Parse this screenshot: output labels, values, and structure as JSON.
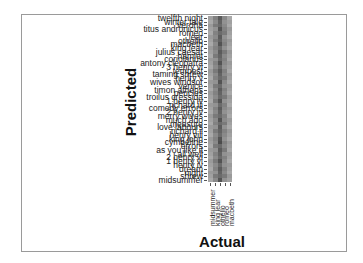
{
  "chart_data": {
    "type": "heatmap",
    "title": "",
    "xlabel": "Actual",
    "ylabel": "Predicted",
    "x_categories": [
      "midsummer",
      "king lear",
      "othello",
      "romeo",
      "macbeth"
    ],
    "x_categories_note": "approximate; only 'midsummer' is clearly legible",
    "y_categories": [
      "twelfth night",
      "winter tale",
      "verona",
      "titus andronicus",
      "romeo",
      "lear",
      "othello",
      "macbeth",
      "king lear",
      "julius caesar",
      "hamlet",
      "coriolanus",
      "antony cleopatra",
      "3 henry vi",
      "tempest",
      "taming shrew",
      "henry v",
      "wives windsor",
      "venice",
      "timon athens",
      "pericles",
      "troilus cressida",
      "1 henry iv",
      "richard iii",
      "comedy errors",
      "2 henry iv",
      "merry wives",
      "much ado",
      "measure",
      "love labours",
      "richard ii",
      "henry viii",
      "king john",
      "cymbeline",
      "errors",
      "as you like it",
      "all well",
      "2 henry vi",
      "1 henry vi",
      "henry iv",
      "dream",
      "night",
      "shrew",
      "midsummer"
    ],
    "y_categories_note": "approximate; labels overlap heavily and are only partially legible",
    "values_note": "illustrative only: cell values are not legible at this resolution; intensities were chosen to match the visible dark-band pattern, not read from the image",
    "values": [
      [
        0.35,
        0.55,
        0.8,
        0.5,
        0.3
      ],
      [
        0.3,
        0.5,
        0.75,
        0.45,
        0.35
      ],
      [
        0.4,
        0.6,
        0.7,
        0.5,
        0.3
      ],
      [
        0.35,
        0.45,
        0.85,
        0.55,
        0.4
      ],
      [
        0.3,
        0.55,
        0.7,
        0.6,
        0.35
      ],
      [
        0.4,
        0.5,
        0.8,
        0.45,
        0.3
      ],
      [
        0.35,
        0.6,
        0.75,
        0.5,
        0.4
      ],
      [
        0.3,
        0.5,
        0.85,
        0.55,
        0.35
      ],
      [
        0.4,
        0.55,
        0.7,
        0.45,
        0.3
      ],
      [
        0.35,
        0.5,
        0.8,
        0.6,
        0.4
      ],
      [
        0.3,
        0.6,
        0.75,
        0.5,
        0.35
      ],
      [
        0.4,
        0.45,
        0.7,
        0.55,
        0.3
      ],
      [
        0.35,
        0.55,
        0.85,
        0.5,
        0.4
      ],
      [
        0.3,
        0.5,
        0.7,
        0.45,
        0.35
      ],
      [
        0.4,
        0.6,
        0.8,
        0.55,
        0.3
      ],
      [
        0.35,
        0.5,
        0.75,
        0.5,
        0.4
      ],
      [
        0.3,
        0.55,
        0.7,
        0.6,
        0.35
      ],
      [
        0.4,
        0.45,
        0.85,
        0.5,
        0.3
      ],
      [
        0.35,
        0.6,
        0.7,
        0.45,
        0.4
      ],
      [
        0.3,
        0.5,
        0.8,
        0.55,
        0.35
      ],
      [
        0.4,
        0.55,
        0.75,
        0.5,
        0.3
      ],
      [
        0.35,
        0.5,
        0.7,
        0.6,
        0.4
      ],
      [
        0.3,
        0.6,
        0.85,
        0.45,
        0.35
      ],
      [
        0.4,
        0.45,
        0.7,
        0.55,
        0.3
      ],
      [
        0.35,
        0.55,
        0.8,
        0.5,
        0.4
      ],
      [
        0.3,
        0.5,
        0.75,
        0.45,
        0.35
      ],
      [
        0.4,
        0.6,
        0.7,
        0.55,
        0.3
      ],
      [
        0.35,
        0.5,
        0.85,
        0.5,
        0.4
      ],
      [
        0.3,
        0.55,
        0.7,
        0.6,
        0.35
      ],
      [
        0.4,
        0.45,
        0.8,
        0.45,
        0.3
      ],
      [
        0.35,
        0.6,
        0.75,
        0.55,
        0.4
      ],
      [
        0.3,
        0.5,
        0.7,
        0.5,
        0.35
      ],
      [
        0.4,
        0.55,
        0.85,
        0.45,
        0.3
      ],
      [
        0.35,
        0.5,
        0.9,
        0.55,
        0.4
      ],
      [
        0.3,
        0.6,
        0.7,
        0.5,
        0.35
      ],
      [
        0.4,
        0.45,
        0.8,
        0.6,
        0.3
      ],
      [
        0.35,
        0.55,
        0.75,
        0.45,
        0.4
      ],
      [
        0.3,
        0.5,
        0.7,
        0.55,
        0.35
      ],
      [
        0.4,
        0.6,
        0.85,
        0.5,
        0.3
      ],
      [
        0.35,
        0.5,
        0.7,
        0.45,
        0.4
      ],
      [
        0.3,
        0.55,
        0.8,
        0.55,
        0.35
      ],
      [
        0.4,
        0.45,
        0.75,
        0.5,
        0.3
      ],
      [
        0.35,
        0.6,
        0.7,
        0.6,
        0.4
      ],
      [
        0.3,
        0.5,
        0.85,
        0.45,
        0.35
      ]
    ],
    "colormap": "grayscale",
    "grid": false,
    "legend": "none"
  },
  "layout": {
    "frame_color": "#9a9a9a",
    "cell_low_color": "#d8d8d8",
    "cell_high_color": "#3c3c3c"
  }
}
